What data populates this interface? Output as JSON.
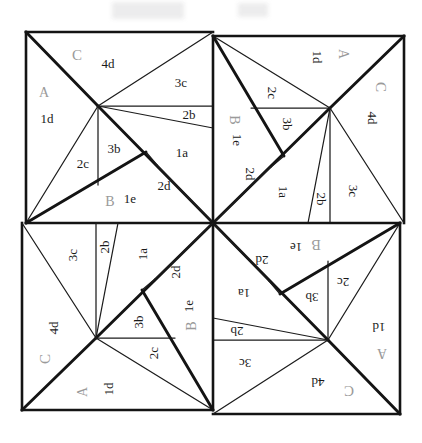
{
  "figure": {
    "symmetry": "4-fold rotational (90, 180, 270 degrees)",
    "background_color": "#ffffff",
    "line_color": "#141414",
    "label_color_dark": "#1a1a1a",
    "label_color_light": "#9a9a9a",
    "outer_square": {
      "x": 26,
      "y": 32,
      "width": 374,
      "height": 382
    },
    "center": {
      "x": 213,
      "y": 223
    },
    "quadrant_labels": [
      {
        "name": "top-left",
        "rotation": 0
      },
      {
        "name": "top-right",
        "rotation": 90
      },
      {
        "name": "bottom-right",
        "rotation": 180
      },
      {
        "name": "bottom-left",
        "rotation": 270
      }
    ],
    "region_labels": [
      {
        "text": "C",
        "x": 77,
        "y": 57,
        "tone": "light",
        "size": 15
      },
      {
        "text": "4d",
        "x": 108,
        "y": 65,
        "tone": "dark",
        "size": 13
      },
      {
        "text": "A",
        "x": 44,
        "y": 94,
        "tone": "light",
        "size": 14
      },
      {
        "text": "1d",
        "x": 47,
        "y": 120,
        "tone": "dark",
        "size": 13
      },
      {
        "text": "3c",
        "x": 181,
        "y": 84,
        "tone": "dark",
        "size": 13
      },
      {
        "text": "2b",
        "x": 189,
        "y": 116,
        "tone": "dark",
        "size": 13
      },
      {
        "text": "1a",
        "x": 182,
        "y": 154,
        "tone": "dark",
        "size": 13
      },
      {
        "text": "3b",
        "x": 114,
        "y": 150,
        "tone": "dark",
        "size": 13
      },
      {
        "text": "2c",
        "x": 83,
        "y": 165,
        "tone": "dark",
        "size": 13
      },
      {
        "text": "2d",
        "x": 164,
        "y": 187,
        "tone": "dark",
        "size": 13
      },
      {
        "text": "B",
        "x": 110,
        "y": 203,
        "tone": "light",
        "size": 14
      },
      {
        "text": "1e",
        "x": 130,
        "y": 200,
        "tone": "dark",
        "size": 13
      }
    ],
    "label_set_per_quadrant": [
      "A",
      "B",
      "C",
      "1a",
      "1d",
      "1e",
      "2b",
      "2c",
      "2d",
      "3b",
      "3c",
      "4d"
    ]
  }
}
